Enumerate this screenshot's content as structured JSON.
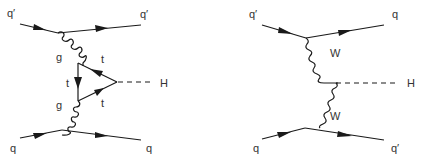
{
  "diagrams": [
    {
      "name": "gluon-fusion-ttH",
      "labels": {
        "in_top": "q′",
        "out_top": "q′",
        "gluon_top": "g",
        "gluon_bottom": "g",
        "top_upper": "t",
        "top_left": "t",
        "top_lower": "t",
        "higgs": "H",
        "in_bottom": "q",
        "out_bottom": "q"
      }
    },
    {
      "name": "vector-boson-fusion",
      "labels": {
        "in_top": "q′",
        "out_top": "q",
        "boson_top": "W",
        "boson_bottom": "W",
        "higgs": "H",
        "in_bottom": "q",
        "out_bottom": "q′"
      }
    }
  ],
  "colors": {
    "line": "#1a1a1a",
    "label": "#333333",
    "background": "#ffffff"
  }
}
